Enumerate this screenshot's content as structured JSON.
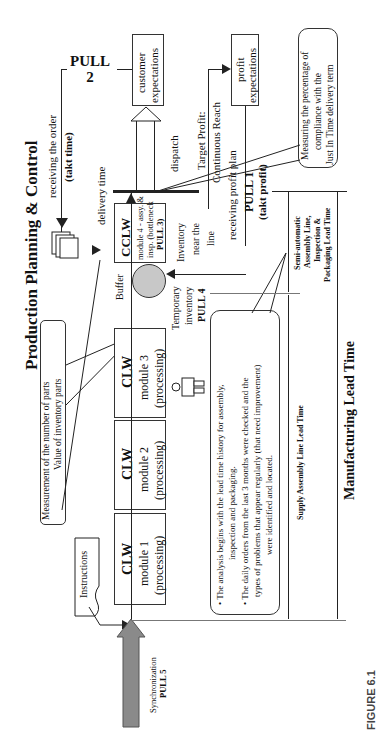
{
  "title": "Production Planning & Control",
  "figure_label": "FIGURE 6.1",
  "pull_labels": {
    "pull1": "PULL 1",
    "pull1_sub": "(takt profit)",
    "pull2": "PULL",
    "pull2_num": "2",
    "pull3": "PULL 3)",
    "pull4": "PULL 4",
    "pull5": "PULL 5"
  },
  "top": {
    "receiving_order": "receiving the order",
    "takt_time": "(takt time)",
    "delivery_time": "delivery time",
    "dispatch": "dispatch",
    "customer_expectations_1": "customer",
    "customer_expectations_2": "expectations",
    "profit_expectations_1": "profit",
    "profit_expectations_2": "expectations",
    "target_profit_1": "Target Profit:",
    "target_profit_2": "Continuous Reach",
    "receiving_profit_plan": "receiving profit plan",
    "measuring_1": "Measuring the percentage of",
    "measuring_2": "compliance with the",
    "measuring_3": "Just In Time delivery term"
  },
  "modules": [
    {
      "title": "CLW",
      "line1": "module 1",
      "line2": "(processing)"
    },
    {
      "title": "CLW",
      "line1": "module 2",
      "line2": "(processing)"
    },
    {
      "title": "CLW",
      "line1": "module 3",
      "line2": "(processing)"
    },
    {
      "title": "CCLW",
      "line1": "module 4 - assy. &",
      "line2": "insp. (bottleneck",
      "line3": "PULL 3)"
    }
  ],
  "buffer": "Buffer",
  "temporary_inventory_1": "Temporary",
  "temporary_inventory_2": "inventory",
  "inventory_near_1": "Inventory",
  "inventory_near_2": "near the",
  "inventory_near_3": "line",
  "measurement_1": "Measurement of the number of parts",
  "measurement_2": "Value of inventory parts",
  "instructions": "Instructions",
  "synchronization": "Synchronization",
  "analysis_notes": [
    "The analysis begins with the lead time history for assembly,",
    "inspection and packaging.",
    "The daily orders from the last 3 months were checked and the",
    "types of problems that appear regularly (that need improvement)",
    "were identified and located."
  ],
  "lead_times": {
    "semi_1": "Semi-automatic",
    "semi_2": "Assembly Line,",
    "semi_3": "Inspection &",
    "semi_4": "Packaging Lead Time",
    "supply": "Supply Assembly Line Lead Time",
    "manufacturing": "Manufacturing Lead Time"
  },
  "colors": {
    "buffer_fill": "#c8c8c8",
    "sync_arrow_fill": "#8a8a8a",
    "line": "#222222"
  }
}
